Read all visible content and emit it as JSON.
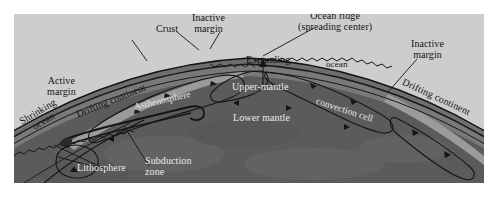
{
  "figure": {
    "domain": "Diagram",
    "background_color": "#ffffff",
    "panel_color": "#cdcdcd"
  },
  "colors": {
    "sky": "#cdcdcd",
    "lower_mantle": "#5b5b5b",
    "upper_mantle": "#787878",
    "asthenosphere": "#6e6e6e",
    "crust": "#2a2a2a",
    "continent": "#9a9a9a",
    "line": "#141414",
    "label_dark": "#141414",
    "label_light": "#e9e9e9"
  },
  "labels": {
    "active_margin": "Active\nmargin",
    "shrinking_ocean": "Shrinking\nocean",
    "drifting_continent_left": "Drifting continent",
    "crust": "Crust",
    "inactive_margin_left": "Inactive\nmargin",
    "expanding": "Expanding",
    "ocean": "ocean",
    "ocean_ridge": "Ocean ridge\n(spreading center)",
    "inactive_margin_right": "Inactive\nmargin",
    "drifting_continent_right": "Drifting continent",
    "asthenosphere": "Asthenosphere",
    "upper_mantle": "Upper-mantle",
    "lower_mantle": "Lower mantle",
    "convection_cell": "convection cell",
    "lithosphere": "Lithosphere",
    "subduction_zone": "Subduction\nzone"
  },
  "label_parts": {
    "active_margin_l1": "Active",
    "active_margin_l2": "margin",
    "shrinking_ocean_l1": "Shrinking",
    "shrinking_ocean_l2": "ocean",
    "inactive_margin_left_l1": "Inactive",
    "inactive_margin_left_l2": "margin",
    "ocean_ridge_l1": "Ocean ridge",
    "ocean_ridge_l2": "(spreading center)",
    "inactive_margin_right_l1": "Inactive",
    "inactive_margin_right_l2": "margin",
    "subduction_zone_l1": "Subduction",
    "subduction_zone_l2": "zone"
  }
}
